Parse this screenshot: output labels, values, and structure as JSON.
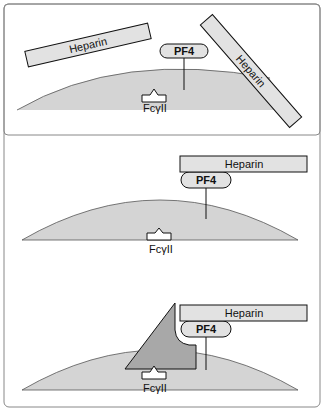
{
  "diagram": {
    "type": "mechanism-illustration",
    "colors": {
      "frame_border": "#888888",
      "cell_fill": "#d4d4d4",
      "heparin_fill": "#e2e2e2",
      "pf4_fill": "#e2e2e2",
      "antibody_fill": "#a8a8a8",
      "receptor_fill": "#ffffff",
      "stroke": "#111111"
    },
    "panels": [
      {
        "id": "panel-1",
        "heparin_label_left": "Heparin",
        "heparin_label_right": "Heparin",
        "pf4_label": "PF4",
        "receptor_label": "FcγII"
      },
      {
        "id": "panel-2",
        "heparin_label": "Heparin",
        "pf4_label": "PF4",
        "receptor_label": "FcγII"
      },
      {
        "id": "panel-3",
        "heparin_label": "Heparin",
        "pf4_label": "PF4",
        "receptor_label": "FcγII"
      }
    ]
  }
}
